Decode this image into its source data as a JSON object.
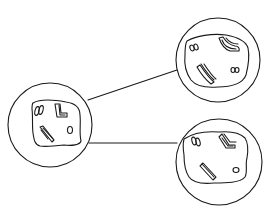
{
  "diagram": {
    "stroke_color": "#1a1a1a",
    "background": "#ffffff",
    "cells": [
      {
        "id": "parent-cell",
        "cx": 50,
        "cy": 125,
        "r": 42
      },
      {
        "id": "daughter-cell-top",
        "cx": 218,
        "cy": 60,
        "r": 42
      },
      {
        "id": "daughter-cell-bottom",
        "cx": 219,
        "cy": 162,
        "r": 43
      }
    ],
    "connectors": [
      {
        "id": "connector-top",
        "x1": 88,
        "y1": 100,
        "x2": 177,
        "y2": 70
      },
      {
        "id": "connector-bottom",
        "x1": 89,
        "y1": 143,
        "x2": 177,
        "y2": 143
      }
    ]
  }
}
